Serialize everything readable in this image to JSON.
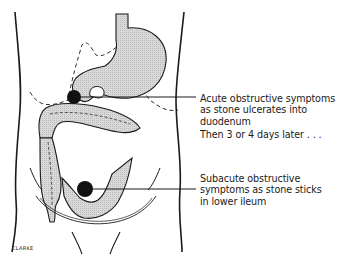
{
  "figure": {
    "colors": {
      "organ_fill": "#d6d6d6",
      "outline": "#1a1a1a",
      "stone": "#111111",
      "background": "#ffffff"
    }
  },
  "annotations": {
    "acute": {
      "lines": [
        "Acute obstructive symptoms",
        "as stone ulcerates into",
        "duodenum"
      ]
    },
    "then": {
      "text": "Then 3 or 4 days later . . ."
    },
    "subacute": {
      "lines": [
        "Subacute obstructive",
        "symptoms as stone sticks",
        "in lower ileum"
      ]
    }
  },
  "signature": "CLARKE"
}
